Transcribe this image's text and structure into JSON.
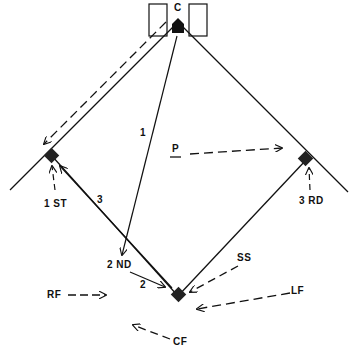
{
  "diagram": {
    "title": "",
    "colors": {
      "ink": "#111111",
      "background": "#ffffff"
    },
    "positions": {
      "catcher": "C",
      "first": "1 ST",
      "second": "2 ND",
      "third": "3 RD",
      "pitcher": "P",
      "shortstop": "SS",
      "left_field": "LF",
      "center_field": "CF",
      "right_field": "RF"
    },
    "throw_labels": {
      "throw1": "1",
      "throw2": "2",
      "throw3": "3"
    }
  }
}
